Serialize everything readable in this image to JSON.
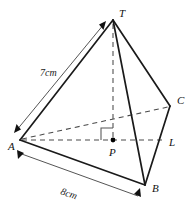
{
  "figure": {
    "shape_type": "tetrahedron",
    "colors": {
      "background": "#ffffff",
      "solid_edge": "#1a1a1a",
      "hidden_edge": "#4a4a4a",
      "dimension_line": "#555555",
      "label_text": "#111111"
    },
    "vertices": [
      {
        "name": "T",
        "label": "T",
        "x": 113,
        "y": 20,
        "label_x": 119,
        "label_y": 17,
        "kind": "apex",
        "dot": false
      },
      {
        "name": "A",
        "label": "A",
        "x": 20,
        "y": 140,
        "label_x": 8,
        "label_y": 150,
        "kind": "base-corner",
        "dot": false
      },
      {
        "name": "B",
        "label": "B",
        "x": 145,
        "y": 185,
        "label_x": 152,
        "label_y": 192,
        "kind": "base-corner",
        "dot": false
      },
      {
        "name": "C",
        "label": "C",
        "x": 170,
        "y": 106,
        "label_x": 177,
        "label_y": 104,
        "kind": "base-corner",
        "dot": false
      },
      {
        "name": "P",
        "label": "P",
        "x": 113,
        "y": 140,
        "label_x": 112,
        "label_y": 155,
        "kind": "foot-of-height",
        "dot": true
      },
      {
        "name": "L",
        "label": "L",
        "x": 166,
        "y": 140,
        "label_x": 170,
        "label_y": 146,
        "kind": "point-on-edge",
        "dot": false
      }
    ],
    "solid_edges": [
      {
        "name": "edge-T-A",
        "from": "T",
        "to": "A"
      },
      {
        "name": "edge-T-B",
        "from": "T",
        "to": "B"
      },
      {
        "name": "edge-T-C",
        "from": "T",
        "to": "C"
      },
      {
        "name": "edge-A-B",
        "from": "A",
        "to": "B"
      },
      {
        "name": "edge-B-C",
        "from": "B",
        "to": "C"
      }
    ],
    "hidden_edges": [
      {
        "name": "edge-A-C-hidden",
        "from": "A",
        "to": "C"
      },
      {
        "name": "edge-A-L-hidden",
        "from": "A",
        "to": "L"
      },
      {
        "name": "edge-T-P-height",
        "from": "T",
        "to": "P"
      }
    ],
    "right_angle": {
      "name": "right-angle-marker-at-P",
      "vertex_x": 113,
      "vertex_y": 140,
      "size": 11,
      "orientation": "up-left"
    },
    "dimensions": [
      {
        "name": "dimension-7cm",
        "label": "7cm",
        "value": 7,
        "unit": "cm",
        "measures": "edge-A-T",
        "label_x": 42,
        "label_y": 74,
        "from_x": 106,
        "from_y": 21,
        "to_x": 14,
        "to_y": 133,
        "arrows": "both"
      },
      {
        "name": "dimension-8cm",
        "label": "8cm",
        "value": 8,
        "unit": "cm",
        "measures": "edge-A-B",
        "label_x": 62,
        "label_y": 192,
        "from_x": 17,
        "from_y": 150,
        "to_x": 141,
        "to_y": 196,
        "arrows": "both"
      }
    ]
  }
}
